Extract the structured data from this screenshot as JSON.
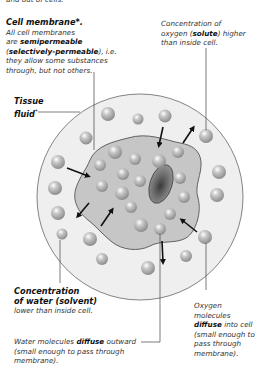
{
  "top_fragment": "and out of cells.",
  "labels": {
    "cell_membrane": {
      "title": "Cell membrane",
      "title_suffix": "*.",
      "line1": "All cell membranes",
      "line2_pre": "are ",
      "line2_bold": "semipermeable",
      "line3_open": "(",
      "line3_bold": "selectively-permeable",
      "line3_post": "), i.e.",
      "line4": "they allow some substances",
      "line5": "through, but not others."
    },
    "oxygen_conc": {
      "line1": "Concentration of",
      "line2_pre": "oxygen (",
      "line2_bold": "solute",
      "line2_post": ") higher",
      "line3": "than inside cell."
    },
    "tissue_fluid": {
      "line1": "Tissue",
      "line2": "fluid",
      "suffix": "*"
    },
    "water_conc": {
      "line1": "Concentration",
      "line2_pre": "of water (",
      "line2_bold": "solvent",
      "line2_post": ")",
      "line3": "lower than inside cell."
    },
    "oxygen_diffuse": {
      "line1": "Oxygen",
      "line2": "molecules",
      "line3_bold": "diffuse",
      "line3_post": " into cell",
      "line4": "(small enough to",
      "line5": "pass through",
      "line6": "membrane)."
    },
    "water_diffuse": {
      "line1_pre": "Water molecules ",
      "line1_bold": "diffuse",
      "line1_post": " outward",
      "line2": "(small enough to pass through",
      "line3": "membrane)."
    }
  },
  "colors": {
    "tissue_fluid": "#ededed",
    "cytoplasm": "#c4c4c4",
    "membrane_stroke": "#555555",
    "nucleus": "#7a7a7a",
    "molecule": "#b0b0b0",
    "arrow": "#111111"
  }
}
